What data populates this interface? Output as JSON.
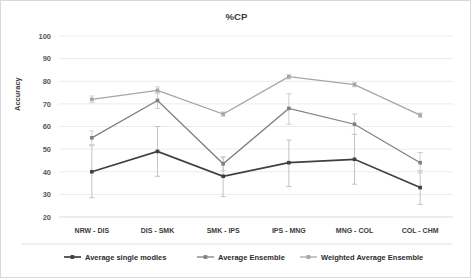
{
  "chart_data": {
    "type": "line",
    "title": "%CP",
    "xlabel": "",
    "ylabel": "Accuracy",
    "ylim": [
      20,
      100
    ],
    "yticks": [
      20,
      30,
      40,
      50,
      60,
      70,
      80,
      90,
      100
    ],
    "grid": true,
    "legend_position": "bottom",
    "categories": [
      "NRW - DIS",
      "DIS - SMK",
      "SMK - IPS",
      "IPS - MNG",
      "MNG - COL",
      "COL - CHM"
    ],
    "series": [
      {
        "name": "Average single modles",
        "color": "#404040",
        "values": [
          40,
          49,
          38,
          44,
          45.5,
          33
        ],
        "error_low": [
          28.5,
          38,
          29,
          33.5,
          34.5,
          25.5
        ],
        "error_high": [
          51.5,
          60,
          46.5,
          54,
          56.5,
          40.5
        ]
      },
      {
        "name": "Average Ensemble",
        "color": "#808080",
        "values": [
          55,
          71.5,
          43.5,
          68,
          61,
          44
        ],
        "error_low": [
          52,
          68,
          40.5,
          61,
          56.5,
          39.5
        ],
        "error_high": [
          58,
          75,
          46.5,
          74.5,
          65.5,
          48.5
        ]
      },
      {
        "name": "Weighted Average Ensemble",
        "color": "#a6a6a6",
        "values": [
          72,
          76,
          65.5,
          82,
          78.5,
          65
        ],
        "error_low": [
          70.5,
          74.5,
          64.5,
          81,
          77.5,
          64
        ],
        "error_high": [
          73.5,
          77.5,
          66.5,
          83,
          79.5,
          66
        ]
      }
    ]
  },
  "legend": {
    "items": [
      {
        "label": "Average single modles"
      },
      {
        "label": "Average Ensemble"
      },
      {
        "label": "Weighted Average Ensemble"
      }
    ]
  },
  "axis": {
    "y_title": "Accuracy"
  }
}
